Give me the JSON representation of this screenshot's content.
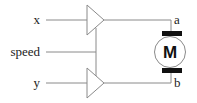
{
  "diagram": {
    "inputs": [
      {
        "label": "x",
        "y": 20
      },
      {
        "label": "speed",
        "y": 52
      },
      {
        "label": "y",
        "y": 83
      }
    ],
    "outputs": [
      {
        "label": "a"
      },
      {
        "label": "b"
      }
    ],
    "motor": {
      "symbol": "M"
    },
    "colors": {
      "line": "#8a8a8a",
      "text": "#222222",
      "brush": "#111111"
    }
  }
}
